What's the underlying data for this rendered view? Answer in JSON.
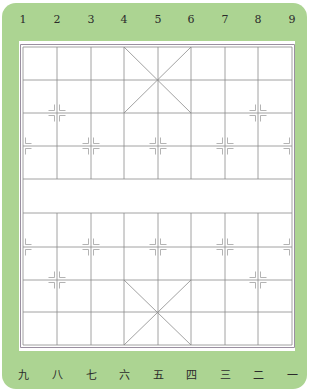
{
  "board": {
    "name": "Xiangqi (Chinese chess) board",
    "files": 9,
    "ranks": 10,
    "river": {
      "between_ranks": [
        5,
        6
      ],
      "text": ""
    },
    "colors": {
      "panel_green": "#acd492",
      "board_white": "#ffffff",
      "grid_line": "#8a8a8a",
      "border_line": "#9a8fa0",
      "marker_line": "#a0a0a0",
      "label_text": "#2b2b2b"
    }
  },
  "top_labels": [
    "1",
    "2",
    "3",
    "4",
    "5",
    "6",
    "7",
    "8",
    "9"
  ],
  "bottom_labels": [
    "九",
    "八",
    "七",
    "六",
    "五",
    "四",
    "三",
    "二",
    "一"
  ],
  "grid": {
    "columns_x": [
      23,
      57,
      91,
      124,
      158,
      191,
      225,
      258,
      292
    ],
    "rows_y": [
      47,
      80,
      113,
      146,
      179,
      213,
      247,
      280,
      312,
      345
    ]
  },
  "palaces": [
    {
      "position": "top",
      "files": [
        4,
        6
      ],
      "ranks": [
        1,
        3
      ]
    },
    {
      "position": "bottom",
      "files": [
        4,
        6
      ],
      "ranks": [
        8,
        10
      ]
    }
  ],
  "position_markers": [
    {
      "type": "cannon",
      "file": 2,
      "rank": 3
    },
    {
      "type": "cannon",
      "file": 8,
      "rank": 3
    },
    {
      "type": "soldier",
      "file": 1,
      "rank": 4
    },
    {
      "type": "soldier",
      "file": 3,
      "rank": 4
    },
    {
      "type": "soldier",
      "file": 5,
      "rank": 4
    },
    {
      "type": "soldier",
      "file": 7,
      "rank": 4
    },
    {
      "type": "soldier",
      "file": 9,
      "rank": 4
    },
    {
      "type": "soldier",
      "file": 1,
      "rank": 7
    },
    {
      "type": "soldier",
      "file": 3,
      "rank": 7
    },
    {
      "type": "soldier",
      "file": 5,
      "rank": 7
    },
    {
      "type": "soldier",
      "file": 7,
      "rank": 7
    },
    {
      "type": "soldier",
      "file": 9,
      "rank": 7
    },
    {
      "type": "cannon",
      "file": 2,
      "rank": 8
    },
    {
      "type": "cannon",
      "file": 8,
      "rank": 8
    }
  ]
}
